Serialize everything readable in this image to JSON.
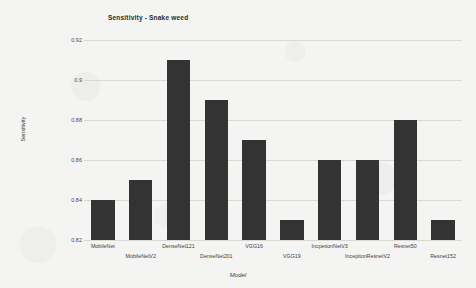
{
  "chart_data": {
    "type": "bar",
    "title": "Sensitivity - Snake weed",
    "xlabel": "Model",
    "ylabel": "Sensitivity",
    "categories": [
      "MobileNet",
      "MobileNetV2",
      "DenseNet121",
      "DenseNet201",
      "VGG16",
      "VGG19",
      "IncpetionNetV3",
      "IncepitonResnetV2",
      "Resnet50",
      "Resnet152"
    ],
    "values": [
      0.84,
      0.85,
      0.91,
      0.89,
      0.87,
      0.83,
      0.86,
      0.86,
      0.88,
      0.83
    ],
    "ylim": [
      0.82,
      0.92
    ],
    "yticks": [
      0.82,
      0.84,
      0.86,
      0.88,
      0.9,
      0.92
    ],
    "ytick_labels": [
      "0.82",
      "0.84",
      "0.86",
      "0.88",
      "0.9",
      "0.92"
    ],
    "grid": true,
    "legend": null,
    "bar_color": "#333333",
    "gridline_color": "#d8d8d4",
    "background_color": "#f4f4f2"
  }
}
